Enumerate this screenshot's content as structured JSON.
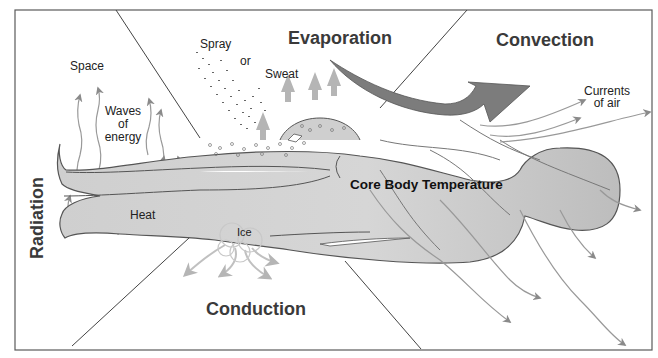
{
  "diagram": {
    "sections": {
      "radiation": "Radiation",
      "evaporation": "Evaporation",
      "convection": "Convection",
      "conduction": "Conduction"
    },
    "labels": {
      "space": "Space",
      "waves_line1": "Waves",
      "waves_line2": "of",
      "waves_line3": "energy",
      "heat": "Heat",
      "spray": "Spray",
      "or": "or",
      "sweat": "Sweat",
      "currents_line1": "Currents",
      "currents_line2": "of air",
      "ice": "Ice",
      "core": "Core Body Temperature"
    },
    "icons": {
      "radiation_arrows": "wavy-up-arrow-icon",
      "evaporation_arrows": "up-arrow-icon",
      "convection_arrow": "curved-arrow-icon",
      "conduction_arrows": "down-arrow-icon",
      "heat_flow_arrows": "wavy-arrow-icon",
      "body": "human-body-silhouette",
      "spray_droplets": "droplets-icon",
      "ice_pack": "ice-icon"
    },
    "colors": {
      "body_fill": "#c9c9c9",
      "body_stroke": "#555555",
      "arrow_fill": "#8a8a8a",
      "light_arrow": "#b9b9b9",
      "convection_arrow": "#7c7c7c",
      "frame": "#555555",
      "title": "#3a3a3a"
    }
  }
}
